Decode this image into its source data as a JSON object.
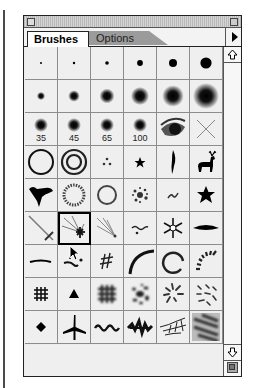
{
  "panel": {
    "tabs": [
      {
        "label": "Brushes",
        "active": true
      },
      {
        "label": "Options",
        "active": false
      }
    ],
    "menu_icon": "triangle-right-icon"
  },
  "brushes": {
    "rows": [
      [
        {
          "type": "hard-round",
          "size": 2
        },
        {
          "type": "hard-round",
          "size": 3
        },
        {
          "type": "hard-round",
          "size": 5
        },
        {
          "type": "hard-round",
          "size": 9
        },
        {
          "type": "hard-round",
          "size": 13
        },
        {
          "type": "hard-round",
          "size": 19
        }
      ],
      [
        {
          "type": "soft-round",
          "size": 5
        },
        {
          "type": "soft-round",
          "size": 9
        },
        {
          "type": "soft-round",
          "size": 13
        },
        {
          "type": "soft-round",
          "size": 17
        },
        {
          "type": "soft-round",
          "size": 21
        },
        {
          "type": "soft-round",
          "size": 27
        }
      ],
      [
        {
          "type": "soft-round",
          "size": 35,
          "label": "35"
        },
        {
          "type": "soft-round",
          "size": 45,
          "label": "45"
        },
        {
          "type": "soft-round",
          "size": 65,
          "label": "65"
        },
        {
          "type": "soft-round",
          "size": 100,
          "label": "100"
        },
        {
          "type": "eye"
        },
        {
          "type": "x-cross"
        }
      ],
      [
        {
          "type": "ring"
        },
        {
          "type": "double-ring"
        },
        {
          "type": "dots-triad"
        },
        {
          "type": "small-star"
        },
        {
          "type": "brush-stroke"
        },
        {
          "type": "deer"
        }
      ],
      [
        {
          "type": "duck"
        },
        {
          "type": "dotted-ring"
        },
        {
          "type": "thin-ring"
        },
        {
          "type": "splatter"
        },
        {
          "type": "squiggle"
        },
        {
          "type": "star"
        }
      ],
      [
        {
          "type": "diagonal-streak"
        },
        {
          "type": "starburst",
          "selected": true
        },
        {
          "type": "rays"
        },
        {
          "type": "tilde-dot"
        },
        {
          "type": "snowflake"
        },
        {
          "type": "leaf-stroke"
        }
      ],
      [
        {
          "type": "dash"
        },
        {
          "type": "comma-dot"
        },
        {
          "type": "hash"
        },
        {
          "type": "arc"
        },
        {
          "type": "open-circle"
        },
        {
          "type": "fan-dashes"
        }
      ],
      [
        {
          "type": "grid"
        },
        {
          "type": "triangle"
        },
        {
          "type": "fuzzy-grid"
        },
        {
          "type": "scatter-blobs"
        },
        {
          "type": "swirl-marks"
        },
        {
          "type": "scatter-marks"
        }
      ],
      [
        {
          "type": "diamond"
        },
        {
          "type": "airplane"
        },
        {
          "type": "wave"
        },
        {
          "type": "jagged"
        },
        {
          "type": "branches"
        },
        {
          "type": "texture"
        }
      ]
    ]
  },
  "scrollbar": {
    "up_icon": "arrow-up-icon",
    "down_icon": "arrow-down-icon",
    "new_brush_icon": "new-brush-icon"
  },
  "cursor": {
    "x": 69,
    "y": 245
  }
}
